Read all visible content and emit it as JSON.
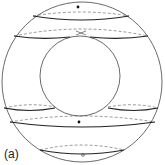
{
  "figure": {
    "panel_label": "(a)",
    "colors": {
      "stroke": "#333333",
      "thin_stroke": "#555555",
      "background": "#ffffff"
    },
    "markers": [
      {
        "type": "filled-dot",
        "position": "top"
      },
      {
        "type": "cross",
        "position": "upper-saddle"
      },
      {
        "type": "filled-dot",
        "position": "lower-middle"
      },
      {
        "type": "open-circle",
        "position": "bottom"
      }
    ]
  }
}
